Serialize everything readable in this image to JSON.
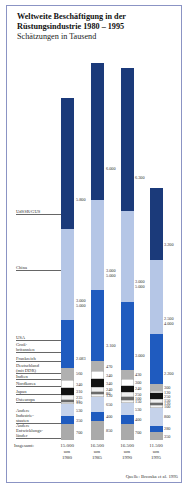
{
  "title": "Weltweite Beschäftigung in der\nRüstungsindustrie 1980 – 1995",
  "subtitle": "Schätzungen in Tausend",
  "source": "Quelle: Brzoska et al. 1995",
  "total_label": "Insgesamt:",
  "totals": [
    "15.000\num\n1980",
    "16.500\num\n1985",
    "16.500\num\n1990",
    "11.500\num\n1995"
  ],
  "colors": {
    "ussr": "#1b3a7a",
    "china": "#b5c6e6",
    "usa": "#1f5bbf",
    "gb": "#b0b0b0",
    "fr": "#ffffff",
    "de": "#111111",
    "in": "#f0f0f0",
    "nk": "#6a6a6a",
    "jp": "#f4f4f4",
    "oe": "#2a4ea6",
    "ai": "#c5d2ea",
    "aind": "#1f5bbf",
    "ae": "#aaaaaa"
  },
  "labels": {
    "ussr": "UdSSR/GUS",
    "china": "China",
    "usa": "USA",
    "gb": "Groß-\nbritannien",
    "fr": "Frankreich",
    "de": "Deutschland\n(mit DDR)",
    "in": "Indien",
    "nk": "Nordkorea",
    "jp": "Japan",
    "oe": "Osteuropa",
    "ai": "Andere\nIndustrie-\nstaaten",
    "ae": "Andere\nEntwicklungs-\nländer"
  },
  "chart_data": {
    "type": "bar",
    "stacked": true,
    "subtitle": "Schätzungen in Tausend",
    "categories": [
      "1980",
      "1985",
      "1990",
      "1995"
    ],
    "totals": [
      15000,
      16500,
      16500,
      11500
    ],
    "series": [
      {
        "name": "UdSSR/GUS",
        "values": [
          5800,
          6000,
          6300,
          3200
        ],
        "labels": [
          "5.800",
          "6.000",
          "6.300",
          "3.200"
        ]
      },
      {
        "name": "China",
        "values": [
          4000,
          4000,
          4000,
          3250
        ],
        "labels": [
          "3.000\n5.000",
          "3.000\n5.000",
          "3.000\n5.000",
          "2.500\n4.000"
        ]
      },
      {
        "name": "USA",
        "values": [
          2083,
          3100,
          3000,
          2200
        ],
        "labels": [
          "2.083",
          "3.100",
          "3.000",
          "2.200"
        ]
      },
      {
        "name": "Großbritannien",
        "values": [
          560,
          470,
          430,
          300
        ],
        "labels": [
          "560",
          "470",
          "430",
          "300"
        ]
      },
      {
        "name": "Frankreich",
        "values": [
          340,
          340,
          300,
          120
        ],
        "labels": [
          "340",
          "340",
          "300",
          "120"
        ]
      },
      {
        "name": "Deutschland (mit DDR)",
        "values": [
          310,
          340,
          240,
          250
        ],
        "labels": [
          "310",
          "340",
          "240",
          "250"
        ]
      },
      {
        "name": "Indien",
        "values": [
          235,
          240,
          250,
          150
        ],
        "labels": [
          "235",
          "240",
          "250",
          "150"
        ]
      },
      {
        "name": "Nordkorea",
        "values": [
          55,
          80,
          100,
          120
        ],
        "labels": [
          "55",
          "80",
          "100",
          "120"
        ]
      },
      {
        "name": "Japan",
        "values": [
          110,
          120,
          150,
          100
        ],
        "labels": [
          "110",
          "120",
          "150",
          "100"
        ]
      },
      {
        "name": "Osteuropa",
        "values": [
          530,
          650,
          530,
          800
        ],
        "labels": [
          "530",
          "650",
          "530",
          "800"
        ]
      },
      {
        "name": "Andere Industriestaaten",
        "values": [
          350,
          400,
          400,
          280
        ],
        "labels": [
          "350",
          "400",
          "400",
          "280"
        ]
      },
      {
        "name": "Andere Entwicklungsländer",
        "values": [
          700,
          850,
          700,
          350
        ],
        "labels": [
          "700",
          "850",
          "700",
          "350"
        ]
      }
    ],
    "xlabel": "",
    "ylabel": "Tausend Beschäftigte",
    "grid": false,
    "legend": "left-side labels with leader lines"
  }
}
